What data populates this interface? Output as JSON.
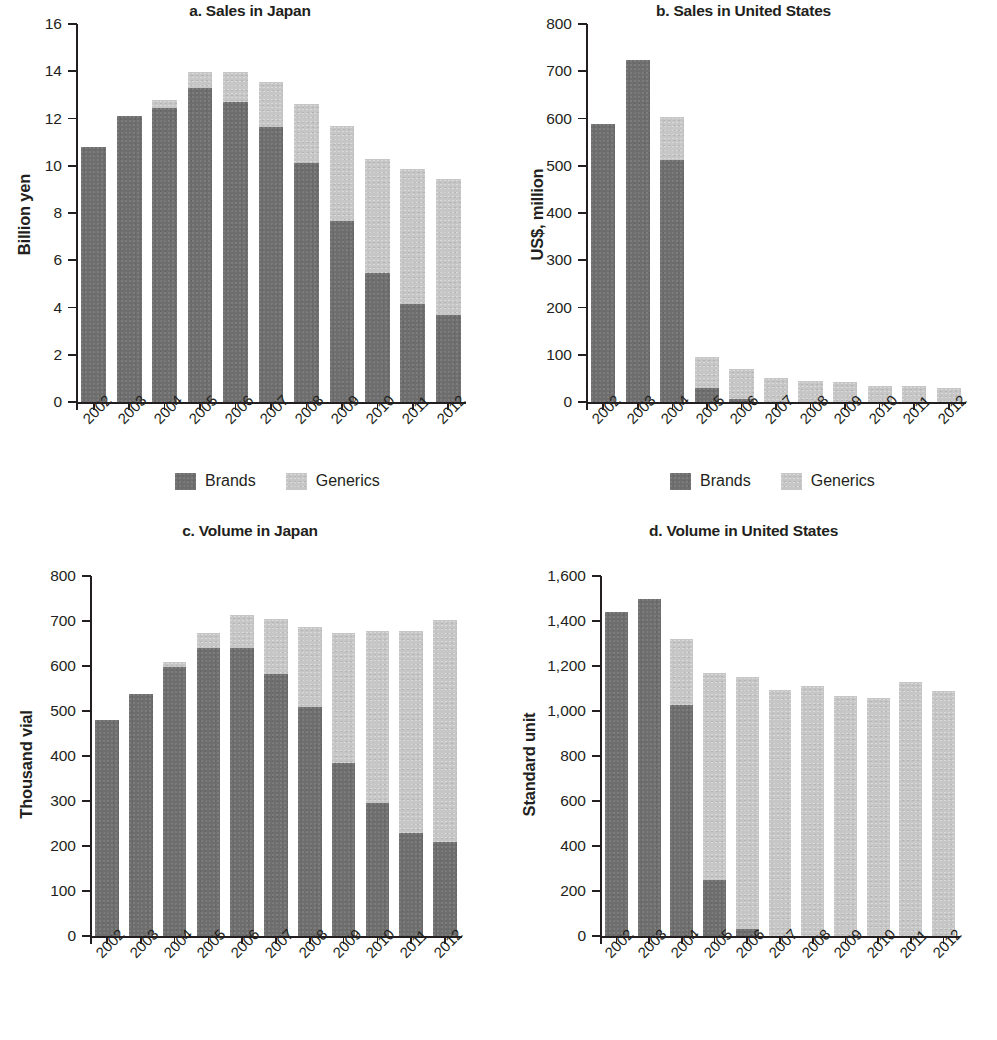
{
  "figure": {
    "legend": {
      "brands_label": "Brands",
      "generics_label": "Generics"
    },
    "colors": {
      "brands": "#6e6e6e",
      "generics": "#c6c6c6",
      "axis": "#231f20",
      "background": "#ffffff"
    }
  },
  "chart_data": [
    {
      "id": "a",
      "type": "bar",
      "subtype": "stacked",
      "title": "a. Sales in Japan",
      "xlabel": "",
      "ylabel": "Billion yen",
      "ylim": [
        0,
        16
      ],
      "yticks": [
        0,
        2,
        4,
        6,
        8,
        10,
        12,
        14,
        16
      ],
      "ytick_labels": [
        "0",
        "2",
        "4",
        "6",
        "8",
        "10",
        "12",
        "14",
        "16"
      ],
      "grid": false,
      "legend_position": "bottom-center",
      "categories": [
        "2002",
        "2003",
        "2004",
        "2005",
        "2006",
        "2007",
        "2008",
        "2009",
        "2010",
        "2011",
        "2012"
      ],
      "series": [
        {
          "name": "Brands",
          "values": [
            10.8,
            12.1,
            12.45,
            13.3,
            12.7,
            11.65,
            10.1,
            7.65,
            5.45,
            4.15,
            3.7
          ]
        },
        {
          "name": "Generics",
          "values": [
            0.0,
            0.0,
            0.35,
            0.65,
            1.25,
            1.9,
            2.5,
            4.05,
            4.85,
            5.7,
            5.75
          ]
        }
      ],
      "totals": [
        10.8,
        12.1,
        12.8,
        13.95,
        13.95,
        13.55,
        12.6,
        11.7,
        10.3,
        9.85,
        9.45
      ]
    },
    {
      "id": "b",
      "type": "bar",
      "subtype": "stacked",
      "title": "b. Sales in United States",
      "xlabel": "",
      "ylabel": "US$, million",
      "ylim": [
        0,
        800
      ],
      "yticks": [
        0,
        100,
        200,
        300,
        400,
        500,
        600,
        700,
        800
      ],
      "ytick_labels": [
        "0",
        "100",
        "200",
        "300",
        "400",
        "500",
        "600",
        "700",
        "800"
      ],
      "grid": false,
      "legend_position": "bottom-center",
      "categories": [
        "2002",
        "2003",
        "2004",
        "2005",
        "2006",
        "2007",
        "2008",
        "2009",
        "2010",
        "2011",
        "2012"
      ],
      "series": [
        {
          "name": "Brands",
          "values": [
            588,
            724,
            513,
            30,
            7,
            0,
            0,
            0,
            0,
            0,
            0
          ]
        },
        {
          "name": "Generics",
          "values": [
            0,
            0,
            90,
            65,
            63,
            50,
            45,
            42,
            34,
            34,
            30
          ]
        }
      ],
      "totals": [
        588,
        724,
        603,
        95,
        70,
        50,
        45,
        42,
        34,
        34,
        30
      ]
    },
    {
      "id": "c",
      "type": "bar",
      "subtype": "stacked",
      "title": "c. Volume in Japan",
      "xlabel": "",
      "ylabel": "Thousand vial",
      "ylim": [
        0,
        800
      ],
      "yticks": [
        0,
        100,
        200,
        300,
        400,
        500,
        600,
        700,
        800
      ],
      "ytick_labels": [
        "0",
        "100",
        "200",
        "300",
        "400",
        "500",
        "600",
        "700",
        "800"
      ],
      "grid": false,
      "legend_position": "bottom-center",
      "categories": [
        "2002",
        "2003",
        "2004",
        "2005",
        "2006",
        "2007",
        "2008",
        "2009",
        "2010",
        "2011",
        "2012"
      ],
      "series": [
        {
          "name": "Brands",
          "values": [
            480,
            537,
            597,
            640,
            640,
            583,
            508,
            385,
            295,
            228,
            210
          ]
        },
        {
          "name": "Generics",
          "values": [
            0,
            0,
            12,
            34,
            73,
            122,
            178,
            288,
            383,
            450,
            492
          ]
        }
      ],
      "totals": [
        480,
        537,
        609,
        674,
        713,
        705,
        686,
        673,
        678,
        678,
        702
      ]
    },
    {
      "id": "d",
      "type": "bar",
      "subtype": "stacked",
      "title": "d. Volume in United States",
      "xlabel": "",
      "ylabel": "Standard unit",
      "ylim": [
        0,
        1600
      ],
      "yticks": [
        0,
        200,
        400,
        600,
        800,
        1000,
        1200,
        1400,
        1600
      ],
      "ytick_labels": [
        "0",
        "200",
        "400",
        "600",
        "800",
        "1,000",
        "1,200",
        "1,400",
        "1,600"
      ],
      "grid": false,
      "legend_position": "bottom-center",
      "categories": [
        "2002",
        "2003",
        "2004",
        "2005",
        "2006",
        "2007",
        "2008",
        "2009",
        "2010",
        "2011",
        "2012"
      ],
      "series": [
        {
          "name": "Brands",
          "values": [
            1442,
            1500,
            1025,
            250,
            32,
            0,
            0,
            0,
            0,
            0,
            0
          ]
        },
        {
          "name": "Generics",
          "values": [
            0,
            0,
            295,
            920,
            1118,
            1095,
            1110,
            1068,
            1060,
            1128,
            1088
          ]
        }
      ],
      "totals": [
        1442,
        1500,
        1320,
        1170,
        1150,
        1095,
        1110,
        1068,
        1060,
        1128,
        1088
      ]
    }
  ]
}
